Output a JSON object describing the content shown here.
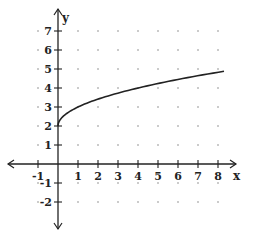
{
  "chart_data": {
    "type": "line",
    "title": "",
    "xlabel": "x",
    "ylabel": "y",
    "xlim": [
      -1.5,
      8.8
    ],
    "ylim": [
      -2.8,
      7.8
    ],
    "x_ticks": [
      -1,
      1,
      2,
      3,
      4,
      5,
      6,
      7,
      8
    ],
    "y_ticks": [
      -2,
      -1,
      1,
      2,
      3,
      4,
      5,
      6,
      7
    ],
    "grid": "dots",
    "function": "y = sqrt(x) + 2",
    "series": [
      {
        "name": "curve",
        "x": [
          0,
          0.25,
          0.5,
          1,
          2,
          3,
          4,
          5,
          6,
          7,
          8,
          8.3
        ],
        "y": [
          2,
          2.5,
          2.71,
          3,
          3.41,
          3.73,
          4,
          4.24,
          4.45,
          4.65,
          4.83,
          4.88
        ]
      }
    ]
  },
  "colors": {
    "axis": "#222222",
    "curve": "#222222",
    "grid_dot": "#888888"
  }
}
